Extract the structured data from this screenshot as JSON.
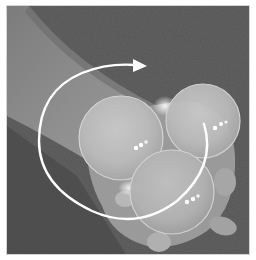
{
  "image": {
    "description": "Grayscale photo of a hand holding three clear contact-juggling balls, with a white circular arrow showing rotation",
    "frame": {
      "border_color": "#d4d4d4",
      "page_background": "#ffffff"
    },
    "scene": {
      "background_color": "#545454",
      "arm_color": "#8a8a8a",
      "hand_color": "#9a9a9a",
      "balls": [
        {
          "name": "left-ball",
          "cx": 114,
          "cy": 132,
          "r": 42
        },
        {
          "name": "right-ball",
          "cx": 196,
          "cy": 115,
          "r": 37
        },
        {
          "name": "bottom-ball",
          "cx": 165,
          "cy": 186,
          "r": 42
        }
      ],
      "rotation_arrow": {
        "color": "#ffffff",
        "direction": "clockwise"
      }
    }
  }
}
